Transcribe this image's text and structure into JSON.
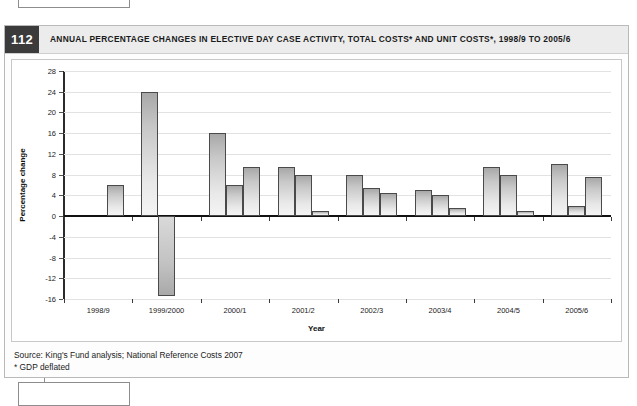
{
  "figure": {
    "number": "112",
    "title": "ANNUAL PERCENTAGE CHANGES IN ELECTIVE DAY CASE ACTIVITY, TOTAL COSTS* AND UNIT COSTS*, 1998/9 TO 2005/6",
    "source": "Source: King's Fund analysis; National Reference Costs 2007",
    "footnote": "* GDP deflated"
  },
  "chart_data": {
    "type": "bar",
    "title": "Annual percentage changes in elective day case activity, total costs* and unit costs*, 1998/9 to 2005/6",
    "xlabel": "Year",
    "ylabel": "Percentage change",
    "ylim": [
      -16,
      28
    ],
    "ytick_step": 4,
    "yticks": [
      28,
      24,
      20,
      16,
      12,
      8,
      4,
      0,
      -4,
      -8,
      -12,
      -16
    ],
    "ytick_labels": [
      "28",
      "24",
      "20",
      "16",
      "12",
      "8",
      "4",
      "0",
      "-4",
      "-8",
      "-12",
      "-16"
    ],
    "grid": true,
    "legend": "none",
    "categories": [
      "1998/9",
      "1999/2000",
      "2000/1",
      "2001/2",
      "2002/3",
      "2003/4",
      "2004/5",
      "2005/6"
    ],
    "series": [
      {
        "name": "Day case activity",
        "values": [
          null,
          6.0,
          16.0,
          9.5,
          8.0,
          5.0,
          9.5,
          10.0
        ]
      },
      {
        "name": "Total costs",
        "values": [
          null,
          24.0,
          6.0,
          8.0,
          5.5,
          4.0,
          8.0,
          2.0
        ]
      },
      {
        "name": "Unit costs",
        "values": [
          null,
          -15.5,
          9.5,
          1.0,
          4.5,
          1.5,
          1.0,
          7.5
        ]
      }
    ],
    "bars_flat": [
      {
        "group": "1998/9",
        "slot": 3,
        "value": 6.0
      },
      {
        "group": "1999/2000",
        "slot": 1,
        "value": 24.0
      },
      {
        "group": "1999/2000",
        "slot": 2,
        "value": -15.5
      },
      {
        "group": "2000/1",
        "slot": 1,
        "value": 16.0
      },
      {
        "group": "2000/1",
        "slot": 2,
        "value": 6.0
      },
      {
        "group": "2000/1",
        "slot": 3,
        "value": 9.5
      },
      {
        "group": "2001/2",
        "slot": 1,
        "value": 9.5
      },
      {
        "group": "2001/2",
        "slot": 2,
        "value": 8.0
      },
      {
        "group": "2001/2",
        "slot": 3,
        "value": 1.0
      },
      {
        "group": "2002/3",
        "slot": 1,
        "value": 8.0
      },
      {
        "group": "2002/3",
        "slot": 2,
        "value": 5.5
      },
      {
        "group": "2002/3",
        "slot": 3,
        "value": 4.5
      },
      {
        "group": "2003/4",
        "slot": 1,
        "value": 5.0
      },
      {
        "group": "2003/4",
        "slot": 2,
        "value": 4.0
      },
      {
        "group": "2003/4",
        "slot": 3,
        "value": 1.5
      },
      {
        "group": "2004/5",
        "slot": 1,
        "value": 9.5
      },
      {
        "group": "2004/5",
        "slot": 2,
        "value": 8.0
      },
      {
        "group": "2004/5",
        "slot": 3,
        "value": 1.0
      },
      {
        "group": "2005/6",
        "slot": 1,
        "value": 10.0
      },
      {
        "group": "2005/6",
        "slot": 2,
        "value": 2.0
      },
      {
        "group": "2005/6",
        "slot": 3,
        "value": 7.5
      }
    ]
  },
  "colors": {
    "bar_fill_top": "#a8a8a8",
    "bar_fill_bottom": "#f4f4f4",
    "bar_border": "#4a4a4a",
    "grid": "#e2e2e2",
    "axis": "#111111",
    "header_bg": "#ececec",
    "number_badge_bg": "#3b3b3b"
  }
}
